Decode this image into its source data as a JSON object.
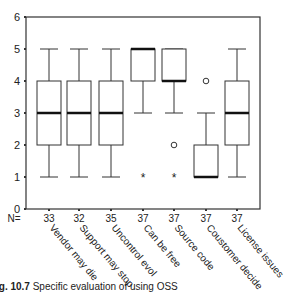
{
  "chart_data": {
    "type": "box",
    "title": "",
    "xlabel": "",
    "ylabel": "",
    "ylim": [
      0,
      6
    ],
    "yticks": [
      0,
      1,
      2,
      3,
      4,
      5,
      6
    ],
    "grid": false,
    "n_label": "N=",
    "categories": [
      "Vendor may die",
      "Support may stop",
      "Uncontrol evol",
      "Can be free",
      "Source code",
      "Coustomer decide",
      "License issues"
    ],
    "n": [
      33,
      32,
      35,
      37,
      37,
      37,
      37
    ],
    "boxes": [
      {
        "label": "Vendor may die",
        "n": 33,
        "whisker_low": 1,
        "q1": 2,
        "median": 3,
        "q3": 4,
        "whisker_high": 5,
        "outliers": [],
        "extremes": []
      },
      {
        "label": "Support may stop",
        "n": 32,
        "whisker_low": 1,
        "q1": 2,
        "median": 3,
        "q3": 4,
        "whisker_high": 5,
        "outliers": [],
        "extremes": []
      },
      {
        "label": "Uncontrol evol",
        "n": 35,
        "whisker_low": 1,
        "q1": 2,
        "median": 3,
        "q3": 4,
        "whisker_high": 5,
        "outliers": [],
        "extremes": []
      },
      {
        "label": "Can be free",
        "n": 37,
        "whisker_low": 3,
        "q1": 4,
        "median": 5,
        "q3": 5,
        "whisker_high": 5,
        "outliers": [],
        "extremes": [
          1
        ]
      },
      {
        "label": "Source code",
        "n": 37,
        "whisker_low": 3,
        "q1": 4,
        "median": 4,
        "q3": 5,
        "whisker_high": 5,
        "outliers": [
          2
        ],
        "extremes": [
          1
        ]
      },
      {
        "label": "Coustomer decide",
        "n": 37,
        "whisker_low": 1,
        "q1": 1,
        "median": 1,
        "q3": 2,
        "whisker_high": 3,
        "outliers": [
          4
        ],
        "extremes": []
      },
      {
        "label": "License issues",
        "n": 37,
        "whisker_low": 1,
        "q1": 2,
        "median": 3,
        "q3": 4,
        "whisker_high": 5,
        "outliers": [],
        "extremes": []
      }
    ],
    "legend": null
  },
  "caption": {
    "prefix": "ig. 10.7",
    "text": "Specific evaluation of using OSS"
  },
  "colors": {
    "line": "#333333",
    "median": "#111111",
    "text": "#222222"
  }
}
